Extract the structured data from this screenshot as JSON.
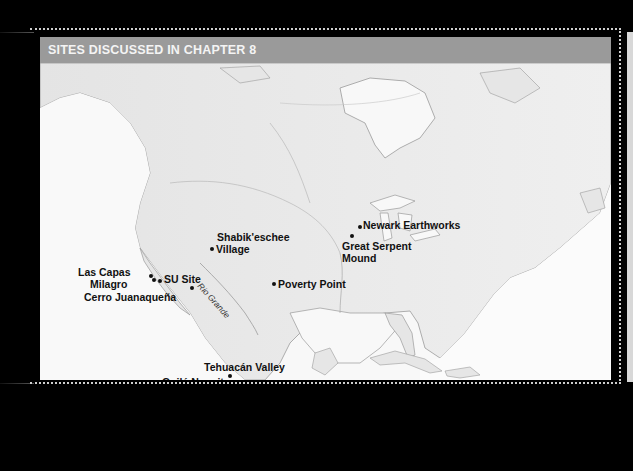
{
  "map": {
    "title": "SITES DISCUSSED IN CHAPTER 8",
    "colors": {
      "background": "#000000",
      "header_bg": "#9a9a9a",
      "header_text": "#f4f4f4",
      "land": "#e6e6e6",
      "water": "#f8f8f8",
      "label": "#111111"
    },
    "river_label": "Rio Grande",
    "sites": [
      {
        "name": "Newark Earthworks"
      },
      {
        "name": "Great Serpent"
      },
      {
        "name": "Mound"
      },
      {
        "name": "Shabik'eschee"
      },
      {
        "name": "Village"
      },
      {
        "name": "Las  Capas"
      },
      {
        "name": "SU Site"
      },
      {
        "name": "Milagro"
      },
      {
        "name": "Cerro Juanaqueña"
      },
      {
        "name": "Poverty Point"
      },
      {
        "name": "Tehuacán Valley"
      },
      {
        "name": "Guilá Naquitz"
      }
    ]
  }
}
